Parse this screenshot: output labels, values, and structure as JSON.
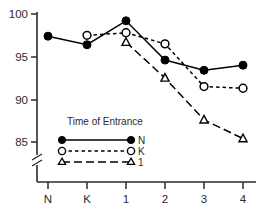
{
  "chart_data": {
    "type": "line",
    "title": "",
    "subtitle": "",
    "xlabel": "",
    "ylabel": "",
    "categories": [
      "N",
      "K",
      "1",
      "2",
      "3",
      "4"
    ],
    "xtick_labels": [
      "N",
      "K",
      "1",
      "2",
      "3",
      "4"
    ],
    "ytick_labels": [
      "100",
      "95",
      "90",
      "85"
    ],
    "ytick_values": [
      100,
      95,
      90,
      85
    ],
    "ylim": [
      83.5,
      100.8
    ],
    "y_axis_break": true,
    "y_axis_break_note": "axis break drawn below 85",
    "grid": false,
    "legend_position": "inside-lower-left",
    "legend_title": "Time of Entrance",
    "series": [
      {
        "name": "N",
        "marker": "filled-circle",
        "line_style": "solid",
        "color": "#000000",
        "values": [
          97.4,
          96.4,
          99.2,
          94.6,
          93.4,
          94.0
        ]
      },
      {
        "name": "K",
        "marker": "open-circle",
        "line_style": "dotted",
        "color": "#000000",
        "values": [
          null,
          97.5,
          97.8,
          96.5,
          91.5,
          91.3
        ]
      },
      {
        "name": "1",
        "marker": "open-triangle",
        "line_style": "dashed",
        "color": "#000000",
        "values": [
          null,
          null,
          96.7,
          92.5,
          87.6,
          85.4
        ]
      }
    ],
    "annotations": []
  },
  "axes": {
    "y_ticks": [
      {
        "label": "100",
        "value": 100
      },
      {
        "label": "95",
        "value": 95
      },
      {
        "label": "90",
        "value": 90
      },
      {
        "label": "85",
        "value": 85
      }
    ],
    "x_ticks": [
      {
        "label": "N"
      },
      {
        "label": "K"
      },
      {
        "label": "1"
      },
      {
        "label": "2"
      },
      {
        "label": "3"
      },
      {
        "label": "4"
      }
    ]
  },
  "legend": {
    "title": "Time of Entrance",
    "entries": [
      {
        "label": "N",
        "marker": "filled-circle",
        "line_style": "solid"
      },
      {
        "label": "K",
        "marker": "open-circle",
        "line_style": "dotted"
      },
      {
        "label": "1",
        "marker": "open-triangle",
        "line_style": "dashed"
      }
    ]
  }
}
